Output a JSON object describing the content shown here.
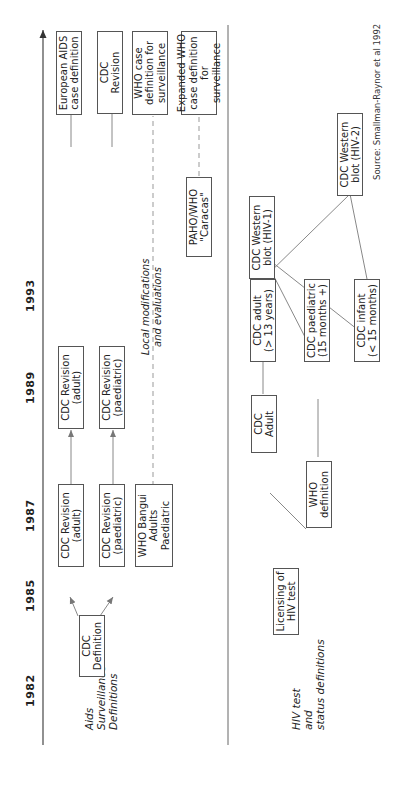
{
  "timeline": {
    "years": [
      "1982",
      "1985",
      "1987",
      "1989",
      "1993"
    ]
  },
  "rows": {
    "aids": {
      "label_lines": [
        "Aids",
        "Surveillance",
        "Definitions"
      ]
    },
    "hiv": {
      "label_lines": [
        "HIV test",
        "and",
        "status definitions"
      ]
    }
  },
  "aids_boxes": {
    "cdc_definition": [
      "CDC",
      "Definition"
    ],
    "cdc_revision_adult_1987": [
      "CDC Revision",
      "(adult)"
    ],
    "cdc_revision_paed_1987": [
      "CDC Revision",
      "(paediatric)"
    ],
    "who_bangui": [
      "WHO Bangui",
      "Adults",
      "Paediatric"
    ],
    "cdc_revision_adult_1989": [
      "CDC Revision",
      "(adult)"
    ],
    "cdc_revision_paed_1989": [
      "CDC Revision",
      "(paediatric)"
    ],
    "paho_who": [
      "PAHO/WHO",
      "\"Caracas\""
    ],
    "european_aids": [
      "European AIDS",
      "case definition"
    ],
    "cdc_revision_1993": [
      "CDC",
      "Revision"
    ],
    "who_case_def": [
      "WHO case",
      "definition for",
      "surveillance"
    ],
    "expanded_who": [
      "Expanded WHO",
      "case definition for",
      "surveillance"
    ]
  },
  "local_note": [
    "Local modifications",
    "and evaluations"
  ],
  "hiv_boxes": {
    "licensing": [
      "Licensing of",
      "HIV test"
    ],
    "who_definition": [
      "WHO",
      "definition"
    ],
    "cdc_adult": [
      "CDC",
      "Adult"
    ],
    "cdc_adult_13": [
      "CDC adult",
      "(> 13 years)"
    ],
    "cdc_paediatric_15": [
      "CDC paediatric",
      "(15 months +)"
    ],
    "cdc_infant": [
      "CDC infant",
      "(< 15 months)"
    ],
    "western_blot_hiv1": [
      "CDC Western",
      "blot (HIV-1)"
    ],
    "western_blot_hiv2": [
      "CDC Western",
      "blot (HIV-2)"
    ]
  },
  "source": "Source: Smallman-Raynor et al 1992",
  "colors": {
    "line": "#888888",
    "box_border": "#555555",
    "text": "#222222"
  }
}
